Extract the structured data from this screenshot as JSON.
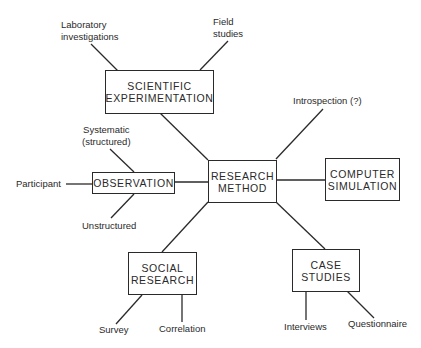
{
  "diagram": {
    "central": {
      "line1": "RESEARCH",
      "line2": "METHOD"
    },
    "methods": {
      "scientific": {
        "line1": "SCIENTIFIC",
        "line2": "EXPERIMENTATION"
      },
      "observation": {
        "line1": "OBSERVATION"
      },
      "computer": {
        "line1": "COMPUTER",
        "line2": "SIMULATION"
      },
      "social": {
        "line1": "SOCIAL",
        "line2": "RESEARCH"
      },
      "case": {
        "line1": "CASE",
        "line2": "STUDIES"
      }
    },
    "leaves": {
      "laboratory": {
        "line1": "Laboratory",
        "line2": "investigations"
      },
      "field": {
        "line1": "Field",
        "line2": "studies"
      },
      "introspection": {
        "line1": "Introspection (?)"
      },
      "systematic": {
        "line1": "Systematic",
        "line2": "(structured)"
      },
      "participant": {
        "line1": "Participant"
      },
      "unstructured": {
        "line1": "Unstructured"
      },
      "survey": {
        "line1": "Survey"
      },
      "correlation": {
        "line1": "Correlation"
      },
      "interviews": {
        "line1": "Interviews"
      },
      "questionnaire": {
        "line1": "Questionnaire"
      }
    },
    "colors": {
      "ink": "#2a2a2a",
      "background": "#ffffff"
    }
  }
}
